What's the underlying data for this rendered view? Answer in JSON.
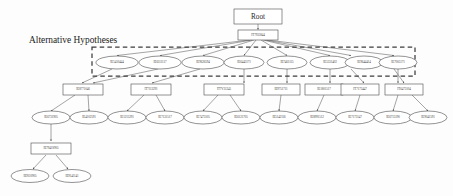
{
  "diagram": {
    "title": "Alternative Hypotheses",
    "root": {
      "label": "Root"
    },
    "level1": [
      {
        "id": "n_l1_0",
        "label": "IT7935844"
      }
    ],
    "hypotheses": [
      {
        "id": "h0",
        "label": "IE5410444"
      },
      {
        "id": "h1",
        "label": "IE6111117"
      },
      {
        "id": "h2",
        "label": "IE9626594"
      },
      {
        "id": "h3",
        "label": "IE6443171"
      },
      {
        "id": "h4",
        "label": "IE7461115"
      },
      {
        "id": "h5",
        "label": "IE5331402"
      },
      {
        "id": "h6",
        "label": "IE9644414"
      },
      {
        "id": "h7",
        "label": "IE7005171"
      }
    ],
    "level3": [
      {
        "id": "r0",
        "label": "IE8771046"
      },
      {
        "id": "r1",
        "label": "IT7113291"
      },
      {
        "id": "r2",
        "label": "IT7V31245"
      },
      {
        "id": "r3",
        "label": "IE9751711"
      },
      {
        "id": "r4",
        "label": "IE1801517"
      },
      {
        "id": "r5",
        "label": "IT7173447"
      },
      {
        "id": "r6",
        "label": "IT6473104"
      }
    ],
    "level4": [
      {
        "id": "e0",
        "label": "IE6731905"
      },
      {
        "id": "e1",
        "label": "IE4102591"
      },
      {
        "id": "e2",
        "label": "IE1215291"
      },
      {
        "id": "e3",
        "label": "IE7131517"
      },
      {
        "id": "e4",
        "label": "IE7473105"
      },
      {
        "id": "e5",
        "label": "IE6121705"
      },
      {
        "id": "e6",
        "label": "IE5142116"
      },
      {
        "id": "e7",
        "label": "IE8991512"
      },
      {
        "id": "e8",
        "label": "IE7173147"
      },
      {
        "id": "e9",
        "label": "IE6715190"
      },
      {
        "id": "e10",
        "label": "IE9041591"
      }
    ],
    "subtree": {
      "parent": {
        "id": "s0",
        "label": "IE7941S905"
      },
      "children": [
        {
          "id": "s1",
          "label": "IE9110905"
        },
        {
          "id": "s2",
          "label": "IE9141141"
        }
      ]
    },
    "colors": {
      "node_stroke": "#4a4a4a",
      "edge": "#5a5a5a",
      "dashed_border": "#3d3d3d",
      "text": "#2b2b2b",
      "background": "#fdfdfd"
    }
  }
}
